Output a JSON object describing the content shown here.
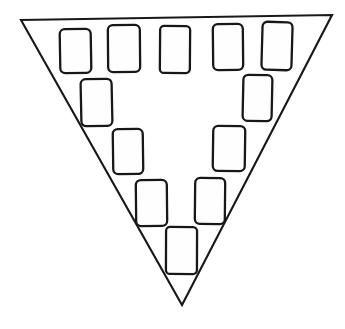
{
  "figure": {
    "name": "inverted-triangle-with-blocks",
    "canvas": {
      "width": 345,
      "height": 329,
      "background": "#ffffff"
    },
    "colors": {
      "stroke": "#18181a",
      "fill": "#ffffff",
      "block_fill": "#fefefe"
    },
    "triangle": {
      "label": "inverted-triangle",
      "orientation": "point-down",
      "stroke_width": 2.1,
      "points": "21,20 332,15 182,305",
      "vertices": [
        {
          "name": "top-left",
          "x": 21,
          "y": 20
        },
        {
          "name": "top-right",
          "x": 332,
          "y": 15
        },
        {
          "name": "bottom-apex",
          "x": 182,
          "y": 305
        }
      ]
    },
    "blocks": [
      {
        "id": "block-1",
        "row": 1,
        "position": "row1-col1",
        "x": 60,
        "y": 29,
        "width": 31,
        "height": 44,
        "rx": 5,
        "rotate": -1.0
      },
      {
        "id": "block-2",
        "row": 1,
        "position": "row1-col2",
        "x": 108,
        "y": 25,
        "width": 32,
        "height": 47,
        "rx": 5,
        "rotate": -0.5
      },
      {
        "id": "block-3",
        "row": 1,
        "position": "row1-col3",
        "x": 160,
        "y": 26,
        "width": 30,
        "height": 47,
        "rx": 4,
        "rotate": 0.4
      },
      {
        "id": "block-4",
        "row": 1,
        "position": "row1-col4",
        "x": 213,
        "y": 24,
        "width": 30,
        "height": 46,
        "rx": 5,
        "rotate": -0.6
      },
      {
        "id": "block-5",
        "row": 1,
        "position": "row1-col5",
        "x": 262,
        "y": 22,
        "width": 30,
        "height": 48,
        "rx": 5,
        "rotate": 1.6
      },
      {
        "id": "block-6",
        "row": 2,
        "position": "row2-left",
        "x": 81,
        "y": 79,
        "width": 31,
        "height": 47,
        "rx": 5,
        "rotate": -1.2
      },
      {
        "id": "block-7",
        "row": 2,
        "position": "row2-right",
        "x": 243,
        "y": 75,
        "width": 29,
        "height": 46,
        "rx": 5,
        "rotate": 1.2
      },
      {
        "id": "block-8",
        "row": 3,
        "position": "row3-left",
        "x": 113,
        "y": 129,
        "width": 30,
        "height": 45,
        "rx": 5,
        "rotate": -0.8
      },
      {
        "id": "block-9",
        "row": 3,
        "position": "row3-right",
        "x": 213,
        "y": 126,
        "width": 32,
        "height": 45,
        "rx": 5,
        "rotate": 0.8
      },
      {
        "id": "block-10",
        "row": 4,
        "position": "row4-left",
        "x": 136,
        "y": 180,
        "width": 31,
        "height": 46,
        "rx": 5,
        "rotate": -0.6
      },
      {
        "id": "block-11",
        "row": 4,
        "position": "row4-right",
        "x": 195,
        "y": 178,
        "width": 30,
        "height": 46,
        "rx": 5,
        "rotate": 0.6
      },
      {
        "id": "block-12",
        "row": 5,
        "position": "row5-center",
        "x": 166,
        "y": 227,
        "width": 31,
        "height": 47,
        "rx": 4,
        "rotate": 0.2
      }
    ]
  }
}
